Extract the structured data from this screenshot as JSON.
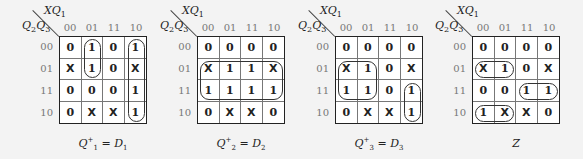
{
  "col_var": "XQ",
  "col_var_sub": "1",
  "row_var": "Q",
  "row_var_sub1": "2",
  "row_var_mid": "Q",
  "row_var_sub2": "3",
  "col_labels": [
    "00",
    "01",
    "11",
    "10"
  ],
  "row_labels": [
    "00",
    "01",
    "11",
    "10"
  ],
  "maps": [
    {
      "id": "D1",
      "caption_main": "Q",
      "caption_sup": "+",
      "caption_sub": "1",
      "caption_eq": " = D",
      "caption_eq_sub": "1",
      "cells": [
        [
          "0",
          "1",
          "0",
          "1"
        ],
        [
          "X",
          "1",
          "0",
          "X"
        ],
        [
          "0",
          "0",
          "0",
          "1"
        ],
        [
          "0",
          "X",
          "X",
          "1"
        ]
      ],
      "loops": [
        {
          "r": 0,
          "c": 1,
          "rows": 2,
          "cols": 1
        },
        {
          "r": 0,
          "c": 3,
          "rows": 4,
          "cols": 1
        }
      ]
    },
    {
      "id": "D2",
      "caption_main": "Q",
      "caption_sup": "+",
      "caption_sub": "2",
      "caption_eq": " = D",
      "caption_eq_sub": "2",
      "cells": [
        [
          "0",
          "0",
          "0",
          "0"
        ],
        [
          "X",
          "1",
          "1",
          "X"
        ],
        [
          "1",
          "1",
          "1",
          "1"
        ],
        [
          "0",
          "X",
          "X",
          "0"
        ]
      ],
      "loops": [
        {
          "r": 1,
          "c": 0,
          "rows": 2,
          "cols": 4
        }
      ]
    },
    {
      "id": "D3",
      "caption_main": "Q",
      "caption_sup": "+",
      "caption_sub": "3",
      "caption_eq": " = D",
      "caption_eq_sub": "3",
      "cells": [
        [
          "0",
          "0",
          "0",
          "0"
        ],
        [
          "X",
          "1",
          "0",
          "X"
        ],
        [
          "1",
          "1",
          "0",
          "1"
        ],
        [
          "0",
          "X",
          "X",
          "1"
        ]
      ],
      "loops": [
        {
          "r": 1,
          "c": 0,
          "rows": 2,
          "cols": 2
        },
        {
          "r": 2,
          "c": 3,
          "rows": 2,
          "cols": 1
        }
      ]
    },
    {
      "id": "Z",
      "caption_main": "Z",
      "caption_sup": "",
      "caption_sub": "",
      "caption_eq": "",
      "caption_eq_sub": "",
      "cells": [
        [
          "0",
          "0",
          "0",
          "0"
        ],
        [
          "X",
          "1",
          "0",
          "X"
        ],
        [
          "0",
          "0",
          "1",
          "1"
        ],
        [
          "1",
          "X",
          "X",
          "0"
        ]
      ],
      "loops": [
        {
          "r": 1,
          "c": 0,
          "rows": 1,
          "cols": 2
        },
        {
          "r": 2,
          "c": 2,
          "rows": 1,
          "cols": 2
        },
        {
          "r": 3,
          "c": 0,
          "rows": 1,
          "cols": 2
        }
      ]
    }
  ]
}
